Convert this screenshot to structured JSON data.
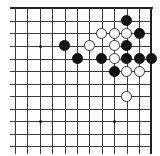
{
  "diagram": {
    "type": "go-board-fragment",
    "region": "top-right corner",
    "grid": {
      "columns": 12,
      "rows": 12,
      "origin_x": 15,
      "origin_y": 8.3,
      "spacing_x": 12.4,
      "spacing_y": 12.55,
      "edges": [
        "top",
        "right"
      ]
    },
    "star_points": [
      {
        "col": 2,
        "row": 3
      },
      {
        "col": 8,
        "row": 3
      },
      {
        "col": 2,
        "row": 9
      },
      {
        "col": 8,
        "row": 9
      }
    ],
    "stones": [
      {
        "color": "black",
        "col": 9,
        "row": 1
      },
      {
        "color": "white",
        "col": 7,
        "row": 2
      },
      {
        "color": "white",
        "col": 8,
        "row": 2
      },
      {
        "color": "white",
        "col": 9,
        "row": 2
      },
      {
        "color": "black",
        "col": 10,
        "row": 2
      },
      {
        "color": "black",
        "col": 4,
        "row": 3
      },
      {
        "color": "white",
        "col": 6,
        "row": 3
      },
      {
        "color": "white",
        "col": 8,
        "row": 3
      },
      {
        "color": "black",
        "col": 9,
        "row": 3
      },
      {
        "color": "black",
        "col": 5,
        "row": 4
      },
      {
        "color": "black",
        "col": 7,
        "row": 4
      },
      {
        "color": "white",
        "col": 8,
        "row": 4
      },
      {
        "color": "black",
        "col": 9,
        "row": 4
      },
      {
        "color": "black",
        "col": 10,
        "row": 4
      },
      {
        "color": "black",
        "col": 11,
        "row": 4
      },
      {
        "color": "black",
        "col": 8,
        "row": 5
      },
      {
        "color": "white",
        "col": 9,
        "row": 5
      },
      {
        "color": "white",
        "col": 10,
        "row": 5
      },
      {
        "color": "white",
        "col": 9,
        "row": 7
      }
    ],
    "colors": {
      "black": "#111111",
      "white": "#ffffff",
      "line": "#3a3a3a"
    }
  }
}
